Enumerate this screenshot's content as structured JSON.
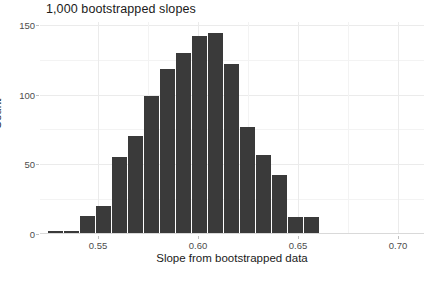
{
  "chart_data": {
    "type": "bar",
    "title": "1,000 bootstrapped slopes",
    "xlabel": "Slope from bootstrapped data",
    "ylabel": "Count",
    "xlim": [
      0.521,
      0.713
    ],
    "ylim": [
      0,
      152
    ],
    "grid": true,
    "legend": null,
    "bin_width": 0.008,
    "bin_starts": [
      0.525,
      0.533,
      0.541,
      0.549,
      0.557,
      0.565,
      0.573,
      0.581,
      0.589,
      0.597,
      0.605,
      0.613,
      0.621,
      0.629,
      0.637,
      0.645,
      0.653,
      0.661,
      0.669,
      0.677
    ],
    "categories": [
      "0.525",
      "0.533",
      "0.541",
      "0.549",
      "0.557",
      "0.565",
      "0.573",
      "0.581",
      "0.589",
      "0.597",
      "0.605",
      "0.613",
      "0.621",
      "0.629",
      "0.637",
      "0.645",
      "0.653",
      "0.661",
      "0.669",
      "0.677"
    ],
    "values": [
      2,
      2,
      13,
      20,
      55,
      70,
      99,
      118,
      130,
      142,
      144,
      122,
      77,
      57,
      42,
      12,
      12,
      1,
      0,
      0
    ],
    "bar_color": "#3a3a3a",
    "x_ticks": [
      {
        "value": 0.55,
        "label": "0.55"
      },
      {
        "value": 0.6,
        "label": "0.60"
      },
      {
        "value": 0.65,
        "label": "0.65"
      },
      {
        "value": 0.7,
        "label": "0.70"
      }
    ],
    "x_minor_ticks": [
      0.575,
      0.625,
      0.675
    ],
    "y_ticks": [
      {
        "value": 0,
        "label": "0"
      },
      {
        "value": 50,
        "label": "50"
      },
      {
        "value": 100,
        "label": "100"
      },
      {
        "value": 150,
        "label": "150"
      }
    ],
    "y_minor_ticks": [
      25,
      75,
      125
    ]
  },
  "colors": {
    "background": "#ffffff",
    "bar": "#3a3a3a",
    "grid_major": "#ebebeb",
    "grid_minor": "#f3f3f3",
    "text": "#1a1a1a",
    "tick_text": "#4d4d4d"
  }
}
